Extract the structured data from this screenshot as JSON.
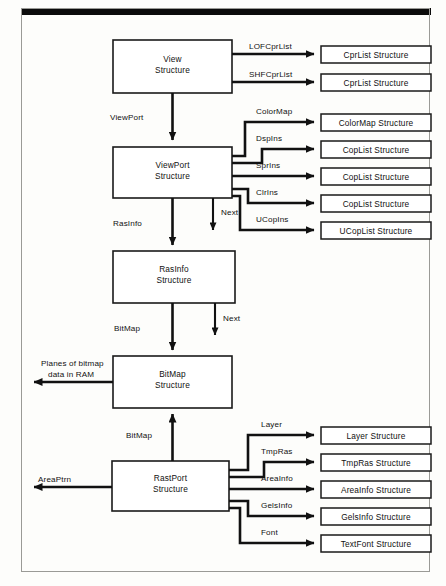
{
  "diagram": {
    "type": "block-pointer-diagram",
    "main_boxes": [
      {
        "id": "view",
        "label_line1": "View",
        "label_line2": "Structure"
      },
      {
        "id": "viewport",
        "label_line1": "ViewPort",
        "label_line2": "Structure"
      },
      {
        "id": "rasinfo",
        "label_line1": "RasInfo",
        "label_line2": "Structure"
      },
      {
        "id": "bitmap",
        "label_line1": "BitMap",
        "label_line2": "Structure"
      },
      {
        "id": "rastport",
        "label_line1": "RastPort",
        "label_line2": "Structure"
      }
    ],
    "right_boxes": [
      {
        "id": "cprlist1",
        "label": "CprList Structure"
      },
      {
        "id": "cprlist2",
        "label": "CprList Structure"
      },
      {
        "id": "colormap",
        "label": "ColorMap Structure"
      },
      {
        "id": "coplist1",
        "label": "CopList Structure"
      },
      {
        "id": "coplist2",
        "label": "CopList Structure"
      },
      {
        "id": "coplist3",
        "label": "CopList Structure"
      },
      {
        "id": "ucoplist",
        "label": "UCopList Structure"
      },
      {
        "id": "layer",
        "label": "Layer Structure"
      },
      {
        "id": "tmpras",
        "label": "TmpRas Structure"
      },
      {
        "id": "areainfo",
        "label": "AreaInfo Structure"
      },
      {
        "id": "gelsinfo",
        "label": "GelsInfo Structure"
      },
      {
        "id": "textfont",
        "label": "TextFont Structure"
      }
    ],
    "edge_labels": {
      "lofcprlist": "LOFCprList",
      "shfcprlist": "SHFCprList",
      "viewport": "ViewPort",
      "colormap": "ColorMap",
      "dspins": "DspIns",
      "sprins": "SprIns",
      "clrins": "ClrIns",
      "ucopins": "UCopIns",
      "rasinfo": "RasInfo",
      "next_viewport": "Next",
      "next_rasinfo": "Next",
      "bitmap_rasinfo": "BitMap",
      "bitmap_rastport": "BitMap",
      "planes_line1": "Planes of bitmap",
      "planes_line2": "data in RAM",
      "areaptrn": "AreaPtrn",
      "layer": "Layer",
      "tmpras": "TmpRas",
      "areainfo": "AreaInfo",
      "gelsinfo": "GelsInfo",
      "font": "Font"
    },
    "colors": {
      "line": "#111111",
      "box_stroke": "#1a1a1a",
      "box_fill": "#ffffff",
      "page_bg": "#fdfdfb",
      "frame": "#9a9a96",
      "topbar": "#0b0b0b"
    }
  }
}
